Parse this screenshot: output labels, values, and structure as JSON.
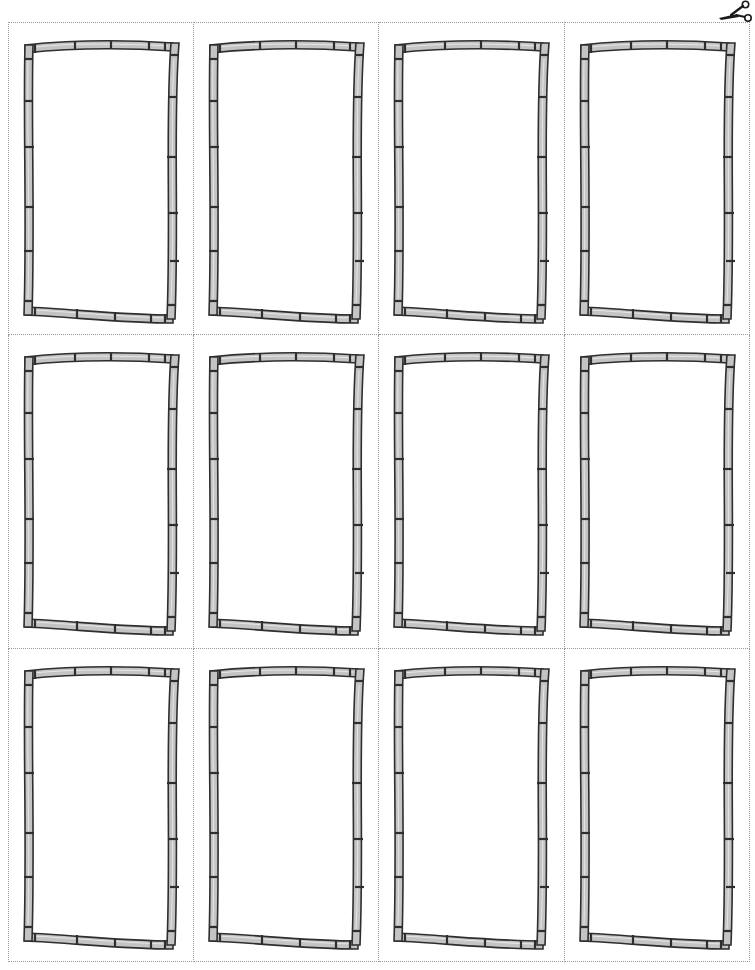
{
  "page": {
    "type": "printable-card-template",
    "layout": {
      "columns": 4,
      "rows": 3
    },
    "cut_line_style": "dotted",
    "colors": {
      "cut_line": "#9a9a9a",
      "frame_fill": "#c4c4c4",
      "frame_highlight": "#e6e6e6",
      "frame_outline": "#2e2e2e",
      "background": "#ffffff"
    }
  },
  "icons": {
    "scissors": "scissors-icon"
  },
  "cards": [
    {
      "row": 1,
      "col": 1,
      "content": ""
    },
    {
      "row": 1,
      "col": 2,
      "content": ""
    },
    {
      "row": 1,
      "col": 3,
      "content": ""
    },
    {
      "row": 1,
      "col": 4,
      "content": ""
    },
    {
      "row": 2,
      "col": 1,
      "content": ""
    },
    {
      "row": 2,
      "col": 2,
      "content": ""
    },
    {
      "row": 2,
      "col": 3,
      "content": ""
    },
    {
      "row": 2,
      "col": 4,
      "content": ""
    },
    {
      "row": 3,
      "col": 1,
      "content": ""
    },
    {
      "row": 3,
      "col": 2,
      "content": ""
    },
    {
      "row": 3,
      "col": 3,
      "content": ""
    },
    {
      "row": 3,
      "col": 4,
      "content": ""
    }
  ]
}
